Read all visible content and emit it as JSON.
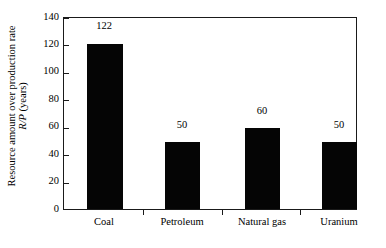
{
  "chart_data": {
    "type": "bar",
    "title": "",
    "subtitle": "",
    "categories": [
      "Coal",
      "Petroleum",
      "Natural gas",
      "Uranium"
    ],
    "values": [
      122,
      50,
      60,
      50
    ],
    "data_labels": [
      "122",
      "50",
      "60",
      "50"
    ],
    "xlabel": "",
    "ylabel_line1": "Resource amount over production rate",
    "ylabel_line2_symbol": "R/P",
    "ylabel_line2_unit": " (years)",
    "ylim": [
      0,
      140
    ],
    "yticks": [
      0,
      20,
      40,
      60,
      80,
      100,
      120,
      140
    ],
    "ytick_labels": [
      "0",
      "20",
      "40",
      "60",
      "80",
      "100",
      "120",
      "140"
    ],
    "grid": false,
    "legend": false,
    "legend_position": "none",
    "bar_color": "#050505",
    "frame_color": "#1a1a1a",
    "background_color": "#ffffff"
  }
}
